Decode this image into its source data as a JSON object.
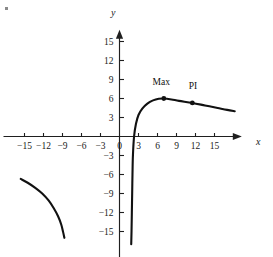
{
  "chart_data": {
    "type": "line",
    "title": "",
    "xlabel": "x",
    "ylabel": "y",
    "xlim": [
      -18,
      19
    ],
    "ylim": [
      -17,
      17
    ],
    "grid": false,
    "legend": null,
    "xticks": [
      -15,
      -12,
      -9,
      -6,
      -3,
      0,
      3,
      6,
      9,
      12,
      15
    ],
    "yticks": [
      -15,
      -12,
      -9,
      -6,
      -3,
      3,
      6,
      9,
      12,
      15
    ],
    "xtick_labels": [
      "-15",
      "-12",
      "-9",
      "-6",
      "-3",
      "0",
      "3",
      "6",
      "9",
      "12",
      "15"
    ],
    "ytick_labels": [
      "-15",
      "-12",
      "-9",
      "-6",
      "-3",
      "3",
      "6",
      "9",
      "12",
      "15"
    ],
    "origin_label": "0",
    "series": [
      {
        "name": "main-branch",
        "comment": "right branch: vertical asymptote near x=1.8, rises steeply, local max then slow decline",
        "points": [
          [
            1.85,
            -17.0
          ],
          [
            1.9,
            -15.0
          ],
          [
            1.95,
            -12.0
          ],
          [
            2.0,
            -9.0
          ],
          [
            2.05,
            -6.0
          ],
          [
            2.12,
            -3.0
          ],
          [
            2.3,
            0.0
          ],
          [
            2.6,
            2.0
          ],
          [
            3.0,
            3.4
          ],
          [
            3.6,
            4.4
          ],
          [
            4.4,
            5.2
          ],
          [
            5.3,
            5.7
          ],
          [
            6.2,
            5.95
          ],
          [
            7.0,
            6.0
          ],
          [
            8.2,
            5.85
          ],
          [
            9.4,
            5.62
          ],
          [
            11.5,
            5.3
          ],
          [
            13.5,
            4.9
          ],
          [
            15.5,
            4.5
          ],
          [
            17.0,
            4.2
          ],
          [
            18.2,
            4.0
          ]
        ]
      },
      {
        "name": "left-branch",
        "comment": "separate branch in third quadrant, decreasing and concave down",
        "points": [
          [
            -15.6,
            -6.7
          ],
          [
            -14.5,
            -7.3
          ],
          [
            -13.3,
            -8.1
          ],
          [
            -12.2,
            -9.0
          ],
          [
            -11.2,
            -10.1
          ],
          [
            -10.4,
            -11.3
          ],
          [
            -9.7,
            -12.6
          ],
          [
            -9.2,
            -13.9
          ],
          [
            -8.9,
            -15.1
          ],
          [
            -8.7,
            -16.0
          ]
        ]
      }
    ],
    "annotations": [
      {
        "label": "Max",
        "x": 7.0,
        "y": 6.0,
        "marker": true,
        "label_dx": -0.4,
        "label_dy": 2.1
      },
      {
        "label": "PI",
        "x": 11.5,
        "y": 5.3,
        "marker": true,
        "label_dx": 0.1,
        "label_dy": 2.2
      }
    ]
  }
}
